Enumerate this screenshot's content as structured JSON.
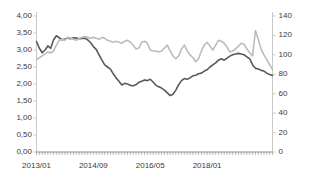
{
  "chart_data": {
    "type": "line",
    "title": "",
    "xlabel": "",
    "ylabel": "",
    "grid": false,
    "legend": "none",
    "x_tick_labels": [
      "2013/01",
      "2014/09",
      "2016/05",
      "2018/01"
    ],
    "x_tick_indices": [
      0,
      20,
      40,
      60
    ],
    "x_start": "2013/01",
    "x_points": 84,
    "axis_left": {
      "min": 0,
      "max": 4,
      "step": 0.5,
      "tick_labels": [
        "0,00",
        "0,50",
        "1,00",
        "1,50",
        "2,00",
        "2,50",
        "3,00",
        "3,50",
        "4,00"
      ],
      "decimal_separator": ","
    },
    "axis_right": {
      "min": 0,
      "max": 140,
      "step": 20,
      "tick_labels": [
        "0",
        "20",
        "40",
        "60",
        "80",
        "100",
        "120",
        "140"
      ]
    },
    "series": [
      {
        "name": "dark-series",
        "axis": "left",
        "color": "#59595b",
        "values": [
          3.25,
          3.05,
          2.92,
          3.0,
          3.12,
          3.05,
          3.3,
          3.42,
          3.36,
          3.3,
          3.32,
          3.35,
          3.33,
          3.36,
          3.35,
          3.33,
          3.34,
          3.35,
          3.3,
          3.22,
          3.1,
          3.02,
          2.86,
          2.7,
          2.56,
          2.5,
          2.44,
          2.3,
          2.18,
          2.08,
          1.97,
          2.02,
          2.0,
          1.96,
          1.95,
          1.98,
          2.05,
          2.08,
          2.12,
          2.1,
          2.14,
          2.06,
          1.96,
          1.92,
          1.88,
          1.82,
          1.74,
          1.66,
          1.7,
          1.82,
          1.98,
          2.1,
          2.16,
          2.14,
          2.18,
          2.24,
          2.26,
          2.3,
          2.32,
          2.38,
          2.42,
          2.5,
          2.56,
          2.62,
          2.7,
          2.74,
          2.7,
          2.76,
          2.82,
          2.86,
          2.88,
          2.9,
          2.88,
          2.86,
          2.8,
          2.74,
          2.56,
          2.46,
          2.44,
          2.4,
          2.38,
          2.32,
          2.28,
          2.25
        ]
      },
      {
        "name": "light-series",
        "axis": "right",
        "color": "#bcbcbc",
        "values": [
          95,
          97,
          99,
          101,
          103,
          102,
          104,
          110,
          115,
          116,
          115,
          118,
          117,
          116,
          115,
          117,
          118,
          119,
          118,
          117,
          118,
          117,
          116,
          118,
          117,
          115,
          114,
          113,
          114,
          113,
          112,
          114,
          115,
          113,
          110,
          106,
          107,
          113,
          114,
          112,
          105,
          104,
          104,
          103,
          104,
          107,
          110,
          104,
          99,
          96,
          99,
          106,
          110,
          104,
          100,
          97,
          93,
          96,
          104,
          110,
          113,
          109,
          105,
          110,
          115,
          114,
          112,
          108,
          103,
          104,
          106,
          109,
          112,
          111,
          106,
          102,
          99,
          125,
          116,
          106,
          100,
          95,
          90,
          85
        ]
      }
    ]
  }
}
